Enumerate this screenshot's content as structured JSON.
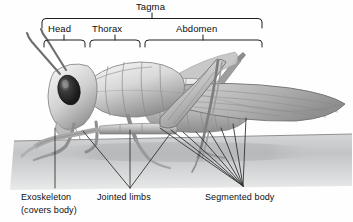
{
  "figure": {
    "style": "grayscale pencil illustration on white background"
  },
  "brackets": {
    "tagma": {
      "label": "Tagma",
      "x_start": 42,
      "x_end": 262,
      "tick_x": 152
    },
    "parts": [
      {
        "id": "head",
        "label": "Head",
        "x_start": 44,
        "x_end": 85,
        "tick_x": 64
      },
      {
        "id": "thorax",
        "label": "Thorax",
        "x_start": 90,
        "x_end": 140,
        "tick_x": 115
      },
      {
        "id": "abdomen",
        "label": "Abdomen",
        "x_start": 145,
        "x_end": 262,
        "tick_x": 203
      }
    ]
  },
  "callouts": [
    {
      "id": "exoskeleton",
      "label": "Exoskeleton",
      "label2": "(covers body)",
      "type": "single-line"
    },
    {
      "id": "jointed-limbs",
      "label": "Jointed limbs",
      "label2": "",
      "type": "v-fan"
    },
    {
      "id": "segmented-body",
      "label": "Segmented body",
      "label2": "",
      "type": "radial-fan"
    }
  ],
  "colors": {
    "ink": "#111111",
    "leader": "#3a3a3a",
    "bracket": "#2b2b2b",
    "background": "#ffffff",
    "ground": "#b9bbbd",
    "body_light": "#e8e8e8",
    "body_mid": "#b4b4b4",
    "body_dark": "#6e6e6e",
    "eye": "#1a1a1a"
  }
}
